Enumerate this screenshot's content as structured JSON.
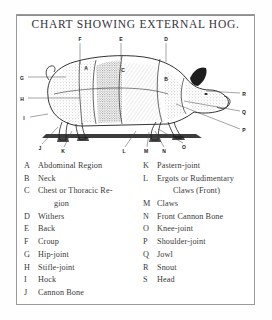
{
  "title": "CHART SHOWING EXTERNAL HOG.",
  "illustration": {
    "subject": "hog-side-view",
    "callouts": [
      {
        "letter": "F",
        "x": 62,
        "y": 5,
        "lx": 62,
        "ly": 9,
        "tx": 62,
        "ty": 30
      },
      {
        "letter": "E",
        "x": 103,
        "y": 5,
        "lx": 103,
        "ly": 9,
        "tx": 103,
        "ty": 26
      },
      {
        "letter": "D",
        "x": 148,
        "y": 5,
        "lx": 148,
        "ly": 9,
        "tx": 148,
        "ty": 28
      },
      {
        "letter": "G",
        "x": 4,
        "y": 44,
        "lx": 10,
        "ly": 43,
        "tx": 48,
        "ty": 43
      },
      {
        "letter": "H",
        "x": 4,
        "y": 65,
        "lx": 10,
        "ly": 64,
        "tx": 62,
        "ty": 64
      },
      {
        "letter": "I",
        "x": 6,
        "y": 84,
        "lx": 12,
        "ly": 83,
        "tx": 30,
        "ty": 80
      },
      {
        "letter": "A",
        "x": 68,
        "y": 34,
        "lx": 0,
        "ly": 0,
        "tx": 0,
        "ty": 0
      },
      {
        "letter": "C",
        "x": 105,
        "y": 36,
        "lx": 0,
        "ly": 0,
        "tx": 0,
        "ty": 0
      },
      {
        "letter": "B",
        "x": 148,
        "y": 45,
        "lx": 0,
        "ly": 0,
        "tx": 0,
        "ty": 0
      },
      {
        "letter": "R",
        "x": 226,
        "y": 60,
        "lx": 222,
        "ly": 59,
        "tx": 188,
        "ty": 57
      },
      {
        "letter": "Q",
        "x": 226,
        "y": 78,
        "lx": 222,
        "ly": 77,
        "tx": 166,
        "ty": 67
      },
      {
        "letter": "P",
        "x": 226,
        "y": 96,
        "lx": 222,
        "ly": 95,
        "tx": 158,
        "ty": 70
      },
      {
        "letter": "J",
        "x": 22,
        "y": 114,
        "lx": 24,
        "ly": 110,
        "tx": 40,
        "ty": 93
      },
      {
        "letter": "K",
        "x": 45,
        "y": 117,
        "lx": 46,
        "ly": 113,
        "tx": 54,
        "ty": 97
      },
      {
        "letter": "L",
        "x": 106,
        "y": 117,
        "lx": 107,
        "ly": 113,
        "tx": 118,
        "ty": 97
      },
      {
        "letter": "M",
        "x": 128,
        "y": 117,
        "lx": 129,
        "ly": 113,
        "tx": 131,
        "ty": 98
      },
      {
        "letter": "N",
        "x": 146,
        "y": 117,
        "lx": 146,
        "ly": 113,
        "tx": 137,
        "ty": 97
      },
      {
        "letter": "O",
        "x": 166,
        "y": 113,
        "lx": 165,
        "ly": 109,
        "tx": 140,
        "ty": 95
      }
    ]
  },
  "legend": {
    "left": [
      {
        "letter": "A",
        "text": "Abdominal Region"
      },
      {
        "letter": "B",
        "text": "Neck"
      },
      {
        "letter": "C",
        "text": "Chest or Thoracic Re-",
        "cont": "gion"
      },
      {
        "letter": "D",
        "text": "Withers"
      },
      {
        "letter": "E",
        "text": "Back"
      },
      {
        "letter": "F",
        "text": "Croup"
      },
      {
        "letter": "G",
        "text": "Hip-joint"
      },
      {
        "letter": "H",
        "text": "Stifle-joint"
      },
      {
        "letter": "I",
        "text": "Hock"
      },
      {
        "letter": "J",
        "text": "Cannon Bone"
      }
    ],
    "right": [
      {
        "letter": "K",
        "text": "Pastern-joint"
      },
      {
        "letter": "L",
        "text": "Ergots or Rudimentary",
        "cont": "Claws (Front)"
      },
      {
        "letter": "M",
        "text": "Claws"
      },
      {
        "letter": "N",
        "text": "Front Cannon Bone"
      },
      {
        "letter": "O",
        "text": "Knee-joint"
      },
      {
        "letter": "P",
        "text": "Shoulder-joint"
      },
      {
        "letter": "Q",
        "text": "Jowl"
      },
      {
        "letter": "R",
        "text": "Snout"
      },
      {
        "letter": "S",
        "text": "Head"
      }
    ]
  },
  "colors": {
    "frame": "#9a9a9a",
    "ink": "#1d1d1d",
    "text": "#3a3a3a",
    "page": "#ffffff"
  }
}
